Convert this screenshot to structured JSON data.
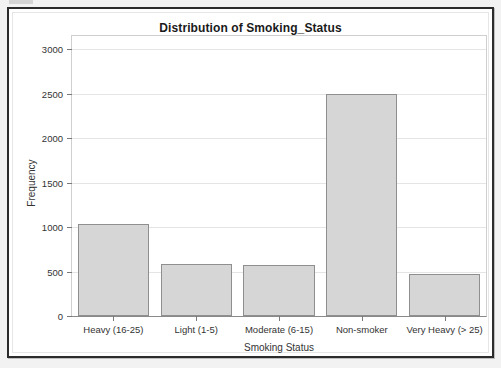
{
  "window": {
    "top_strip_name": "cropped-toolbar-strip"
  },
  "chart_data": {
    "type": "bar",
    "title": "Distribution of Smoking_Status",
    "xlabel": "Smoking Status",
    "ylabel": "Frequency",
    "categories": [
      "Heavy (16-25)",
      "Light (1-5)",
      "Moderate (6-15)",
      "Non-smoker",
      "Very Heavy (> 25)"
    ],
    "values": [
      1040,
      580,
      575,
      2500,
      475
    ],
    "ylim": [
      0,
      3150
    ],
    "yticks": [
      0,
      500,
      1000,
      1500,
      2000,
      2500,
      3000
    ],
    "ytick_labels": [
      "0",
      "500",
      "1000",
      "1500",
      "2000",
      "2500",
      "3000"
    ],
    "grid": true,
    "legend": false,
    "bar_fill_color": "#d6d6d6",
    "bar_edge_color": "#8f8f8f",
    "grid_color": "#e4e4e4",
    "frame_color": "#2b2b2b"
  }
}
